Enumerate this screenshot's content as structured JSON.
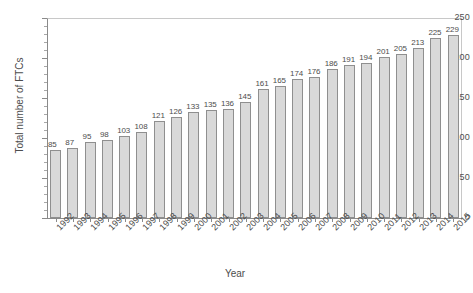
{
  "chart_data": {
    "type": "bar",
    "title": "",
    "xlabel": "Year",
    "ylabel": "Total number of FTCs",
    "categories": [
      "1992",
      "1993",
      "1994",
      "1995",
      "1996",
      "1997",
      "1998",
      "1999",
      "2000",
      "2001",
      "2002",
      "2003",
      "2004",
      "2005",
      "2006",
      "2007",
      "2008",
      "2009",
      "2010",
      "2011",
      "2012",
      "2013",
      "2014",
      "2015"
    ],
    "values": [
      85,
      87,
      95,
      98,
      103,
      108,
      121,
      126,
      133,
      135,
      136,
      145,
      161,
      165,
      174,
      176,
      186,
      191,
      194,
      201,
      205,
      213,
      225,
      229
    ],
    "ylim": [
      0,
      250
    ],
    "y_major_ticks": [
      0,
      50,
      100,
      150,
      200,
      250
    ],
    "y_tick_labels": [
      "0",
      "50",
      "100",
      "150",
      "200",
      "250"
    ],
    "y_minor_tick_step": 10,
    "grid": false,
    "legend": false,
    "legend_position": "none",
    "data_labels_shown": true,
    "bar_fill_color": "#d9d9d9",
    "bar_border_color": "#8f8f8f",
    "axis_color": "#8a8a8a",
    "text_color": "#4d4d4d",
    "background_color": "#ffffff",
    "xtick_label_rotation": 45
  }
}
